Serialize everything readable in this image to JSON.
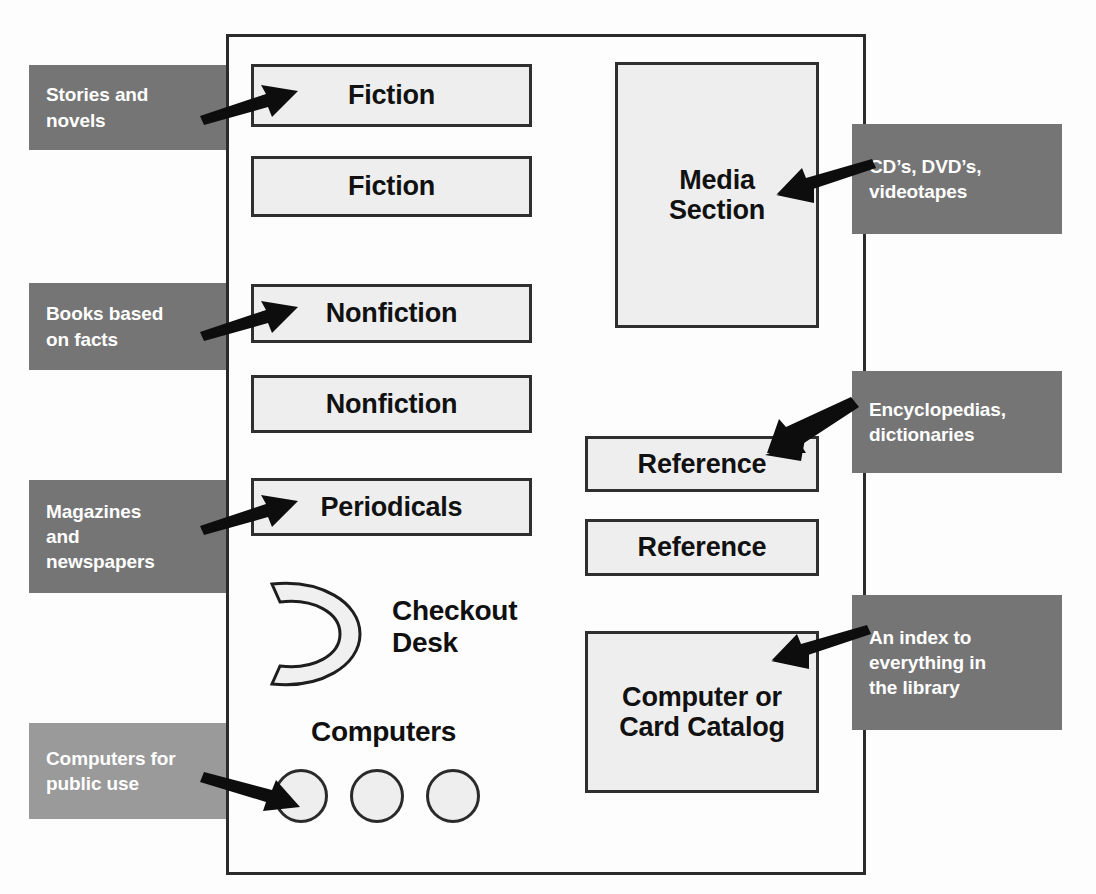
{
  "diagram": {
    "colors": {
      "callout_dark": "#757575",
      "callout_light": "#9a9a9a",
      "box_fill": "#eeeeee",
      "box_border": "#2f2f2f",
      "arrow": "#0d0d0d"
    }
  },
  "left_areas": [
    {
      "label": "Fiction"
    },
    {
      "label": "Fiction"
    },
    {
      "label": "Nonfiction"
    },
    {
      "label": "Nonfiction"
    },
    {
      "label": "Periodicals"
    }
  ],
  "right_areas": [
    {
      "label": "Media\nSection",
      "line1": "Media",
      "line2": "Section"
    },
    {
      "label": "Reference"
    },
    {
      "label": "Reference"
    },
    {
      "label": "Computer or\nCard Catalog",
      "line1": "Computer or",
      "line2": "Card Catalog"
    }
  ],
  "left_callouts": [
    {
      "lines": [
        "Stories and",
        "novels"
      ],
      "shade": "dark"
    },
    {
      "lines": [
        "Books based",
        "on facts"
      ],
      "shade": "dark"
    },
    {
      "lines": [
        "Magazines",
        "and",
        "newspapers"
      ],
      "shade": "dark"
    },
    {
      "lines": [
        "Computers for",
        "public use"
      ],
      "shade": "light"
    }
  ],
  "right_callouts": [
    {
      "lines": [
        "CD’s, DVD’s,",
        "videotapes"
      ],
      "shade": "dark"
    },
    {
      "lines": [
        "Encyclopedias,",
        "dictionaries"
      ],
      "shade": "dark"
    },
    {
      "lines": [
        "An index to",
        "everything in",
        "the library"
      ],
      "shade": "dark"
    }
  ],
  "fixtures": {
    "checkout_desk": {
      "line1": "Checkout",
      "line2": "Desk"
    },
    "computers": {
      "label": "Computers",
      "station_count": 3
    }
  }
}
